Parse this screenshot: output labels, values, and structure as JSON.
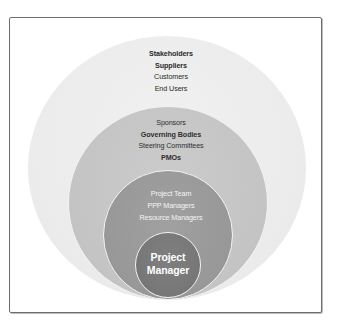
{
  "diagram": {
    "type": "nested-circles",
    "title": "",
    "rings": [
      {
        "id": "outer",
        "color": "#ececec",
        "labels": [
          "Stakeholders",
          "Suppliers",
          "Customers",
          "End Users"
        ]
      },
      {
        "id": "second",
        "color": "#c6c6c6",
        "labels": [
          "Sponsors",
          "Governing Bodies",
          "Steering Committees",
          "PMOs"
        ]
      },
      {
        "id": "third",
        "color": "#9a9a9a",
        "labels": [
          "Project Team",
          "PPP Managers",
          "Resource Managers"
        ]
      },
      {
        "id": "inner",
        "color": "#797979",
        "labels": [
          "Project",
          "Manager"
        ]
      }
    ]
  }
}
